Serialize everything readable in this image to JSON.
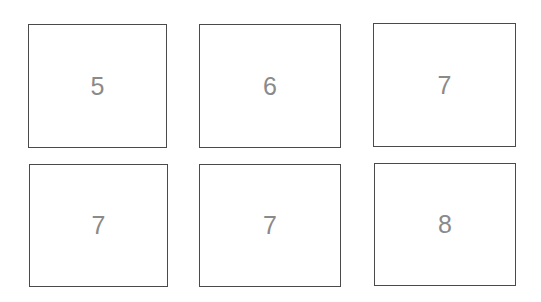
{
  "grid": {
    "rows": 2,
    "columns": 3,
    "boxes": [
      {
        "label": "5"
      },
      {
        "label": "6"
      },
      {
        "label": "7"
      },
      {
        "label": "7"
      },
      {
        "label": "7"
      },
      {
        "label": "8"
      }
    ]
  },
  "colors": {
    "border": "#4a4a4a",
    "text": "#8a8a8a",
    "background": "#ffffff"
  }
}
